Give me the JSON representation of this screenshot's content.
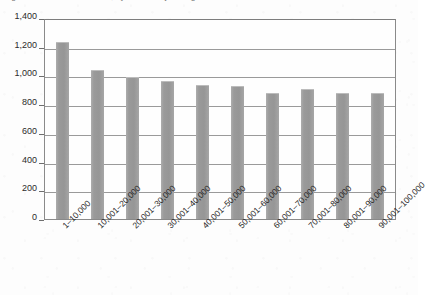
{
  "caption": {
    "text": "Figure 1.  Number of returns, by size of adjusted gross income"
  },
  "chart_data": {
    "type": "bar",
    "title": "",
    "xlabel": "",
    "ylabel": "",
    "categories": [
      "1–10,000",
      "10,001–20,000",
      "20,001–30,000",
      "30,001–40,000",
      "40,001–50,000",
      "50,001–60,000",
      "60,001–70,000",
      "70,001–80,000",
      "80,001–90,000",
      "90,001–100,000"
    ],
    "values": [
      1230,
      1035,
      990,
      960,
      935,
      925,
      880,
      905,
      880,
      880
    ],
    "ylim": [
      0,
      1400
    ],
    "ytick_values": [
      0,
      200,
      400,
      600,
      800,
      1000,
      1200,
      1400
    ],
    "ytick_labels": [
      "0",
      "200",
      "400",
      "600",
      "800",
      "1,000",
      "1,200",
      "1,400"
    ],
    "grid": true,
    "legend": false,
    "legend_position": "none",
    "bar_color": "#9b9b9b",
    "axis_color": "#8a8a8a",
    "gridline_color": "#9a9a9a",
    "background_color": "#fefefe"
  }
}
